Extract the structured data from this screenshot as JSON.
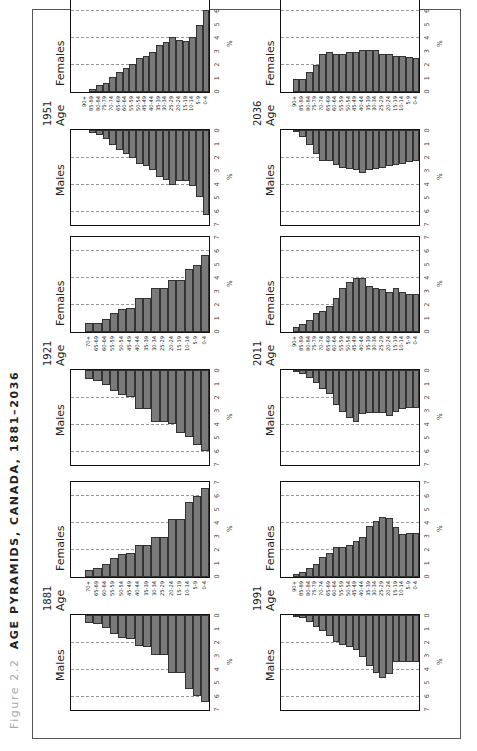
{
  "figure": {
    "label": "Figure 2.2",
    "title": "AGE PYRAMIDS, CANADA, 1881–2036"
  },
  "labels": {
    "males": "Males",
    "females": "Females",
    "age": "Age",
    "pct": "%"
  },
  "chart_data": {
    "type": "bar",
    "subtype": "population-pyramid",
    "title": "AGE PYRAMIDS, CANADA, 1881–2036",
    "xlabel": "%",
    "xlim": [
      0,
      7
    ],
    "x_ticks": [
      0,
      1,
      2,
      3,
      4,
      5,
      6,
      7
    ],
    "grid": "dashed vertical at 2, 4, 6",
    "panels": [
      {
        "year": "1881",
        "age_groups": [
          "70+",
          "65-69",
          "60-64",
          "55-59",
          "50-54",
          "45-49",
          "40-44",
          "35-39",
          "30-34",
          "25-29",
          "20-24",
          "15-19",
          "10-14",
          "5-9",
          "0-4"
        ],
        "males": [
          0.6,
          0.7,
          1.0,
          1.4,
          1.7,
          1.8,
          2.3,
          2.4,
          3.0,
          3.0,
          4.3,
          4.3,
          5.5,
          6.0,
          6.5
        ],
        "females": [
          0.5,
          0.7,
          1.0,
          1.4,
          1.7,
          1.8,
          2.4,
          2.4,
          3.0,
          3.0,
          4.3,
          4.3,
          5.6,
          6.0,
          6.6
        ]
      },
      {
        "year": "1921",
        "age_groups": [
          "70+",
          "65-69",
          "60-64",
          "55-59",
          "50-54",
          "45-49",
          "40-44",
          "35-39",
          "30-34",
          "25-29",
          "20-24",
          "15-19",
          "10-14",
          "5-9",
          "0-4"
        ],
        "males": [
          0.7,
          0.8,
          1.1,
          1.6,
          1.9,
          2.0,
          2.9,
          2.9,
          3.9,
          3.9,
          4.0,
          4.7,
          5.0,
          5.6,
          6.0
        ],
        "females": [
          0.7,
          0.7,
          1.0,
          1.4,
          1.7,
          1.8,
          2.5,
          2.5,
          3.3,
          3.3,
          3.9,
          3.9,
          4.7,
          5.0,
          5.7
        ]
      },
      {
        "year": "1951",
        "age_groups": [
          "90+",
          "85-89",
          "80-84",
          "75-79",
          "70-74",
          "65-69",
          "60-64",
          "55-59",
          "50-54",
          "45-49",
          "40-44",
          "35-39",
          "30-34",
          "25-29",
          "20-24",
          "15-19",
          "10-14",
          "5-9",
          "0-4"
        ],
        "males": [
          0.0,
          0.2,
          0.4,
          0.7,
          1.1,
          1.5,
          1.8,
          2.1,
          2.5,
          2.7,
          3.0,
          3.5,
          3.7,
          4.1,
          3.8,
          3.8,
          4.2,
          5.0,
          6.3
        ],
        "females": [
          0.0,
          0.2,
          0.5,
          0.7,
          1.1,
          1.5,
          1.8,
          2.1,
          2.5,
          2.7,
          3.0,
          3.5,
          3.7,
          4.1,
          3.9,
          3.8,
          4.1,
          5.0,
          6.1
        ]
      },
      {
        "year": "1991",
        "age_groups": [
          "90+",
          "85-89",
          "80-84",
          "75-79",
          "70-74",
          "65-69",
          "60-64",
          "55-59",
          "50-54",
          "45-49",
          "40-44",
          "35-39",
          "30-34",
          "25-29",
          "20-24",
          "15-19",
          "10-14",
          "5-9",
          "0-4"
        ],
        "males": [
          0.05,
          0.2,
          0.5,
          0.9,
          1.2,
          1.6,
          2.0,
          2.2,
          2.4,
          2.6,
          3.1,
          3.8,
          4.3,
          4.7,
          4.4,
          3.5,
          3.5,
          3.5,
          3.5
        ],
        "females": [
          0.2,
          0.4,
          0.7,
          1.0,
          1.5,
          1.8,
          2.2,
          2.2,
          2.4,
          2.7,
          3.0,
          3.8,
          4.2,
          4.5,
          4.4,
          3.7,
          3.2,
          3.3,
          3.3
        ]
      },
      {
        "year": "2011",
        "age_groups": [
          "90+",
          "85-89",
          "80-84",
          "75-79",
          "70-74",
          "65-69",
          "60-64",
          "55-59",
          "50-54",
          "45-49",
          "40-44",
          "35-39",
          "30-34",
          "25-29",
          "20-24",
          "15-19",
          "10-14",
          "5-9",
          "0-4"
        ],
        "males": [
          0.1,
          0.3,
          0.6,
          1.0,
          1.4,
          1.8,
          2.6,
          3.1,
          3.6,
          3.9,
          3.3,
          3.2,
          3.2,
          3.2,
          3.4,
          3.1,
          2.9,
          2.8,
          2.8
        ],
        "females": [
          0.4,
          0.6,
          0.9,
          1.4,
          1.6,
          1.9,
          2.5,
          3.3,
          3.7,
          4.0,
          4.0,
          3.4,
          3.3,
          3.2,
          3.0,
          3.3,
          3.0,
          2.8,
          2.8
        ]
      },
      {
        "year": "2036",
        "age_groups": [
          "90+",
          "85-89",
          "80-84",
          "75-79",
          "70-74",
          "65-69",
          "60-64",
          "55-59",
          "50-54",
          "45-49",
          "40-44",
          "35-39",
          "30-34",
          "25-29",
          "20-24",
          "15-19",
          "10-14",
          "5-9",
          "0-4"
        ],
        "males": [
          0.1,
          0.5,
          1.1,
          1.8,
          2.3,
          2.3,
          2.6,
          2.8,
          2.9,
          3.0,
          3.2,
          3.0,
          2.9,
          2.8,
          2.7,
          2.6,
          2.5,
          2.4,
          2.3
        ],
        "females": [
          1.0,
          1.0,
          1.5,
          2.0,
          2.8,
          3.0,
          2.8,
          2.8,
          3.0,
          3.0,
          3.1,
          3.1,
          3.1,
          2.8,
          2.8,
          2.7,
          2.7,
          2.6,
          2.5
        ]
      }
    ]
  }
}
